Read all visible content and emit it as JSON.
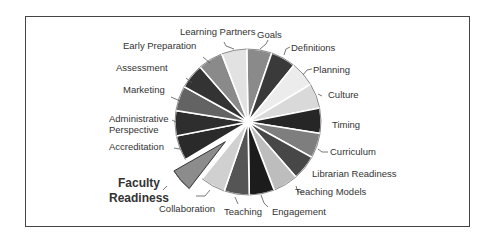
{
  "chart_data": {
    "type": "pie",
    "title": "",
    "start_angle_deg": 0,
    "direction": "clockwise",
    "highlighted": "Faculty Readiness",
    "slices": [
      {
        "label": "Goals",
        "value": 1,
        "color": "#8a8a8a"
      },
      {
        "label": "Definitions",
        "value": 1,
        "color": "#3a3a3a"
      },
      {
        "label": "Planning",
        "value": 1,
        "color": "#ececec"
      },
      {
        "label": "Culture",
        "value": 1,
        "color": "#d9d9d9"
      },
      {
        "label": "Timing",
        "value": 1,
        "color": "#262626"
      },
      {
        "label": "Curriculum",
        "value": 1,
        "color": "#7e7e7e"
      },
      {
        "label": "Librarian Readiness",
        "value": 1,
        "color": "#474747"
      },
      {
        "label": "Teaching Models",
        "value": 1,
        "color": "#bdbdbd"
      },
      {
        "label": "Engagement",
        "value": 1,
        "color": "#1c1c1c"
      },
      {
        "label": "Teaching",
        "value": 1,
        "color": "#555555"
      },
      {
        "label": "Collaboration",
        "value": 1,
        "color": "#d0d0d0"
      },
      {
        "label": "Faculty Readiness",
        "value": 1,
        "color": "#8c8c8c",
        "exploded": true
      },
      {
        "label": "Accreditation",
        "value": 1,
        "color": "#2a2a2a"
      },
      {
        "label": "Administrative Perspective",
        "value": 1,
        "color": "#2e2e2e"
      },
      {
        "label": "Marketing",
        "value": 1,
        "color": "#636363"
      },
      {
        "label": "Assessment",
        "value": 1,
        "color": "#333333"
      },
      {
        "label": "Early Preparation",
        "value": 1,
        "color": "#8a8a8a"
      },
      {
        "label": "Learning Partners",
        "value": 1,
        "color": "#e2e2e2"
      }
    ]
  },
  "labels": {
    "goals": "Goals",
    "definitions": "Definitions",
    "planning": "Planning",
    "culture": "Culture",
    "timing": "Timing",
    "curriculum": "Curriculum",
    "librarian_readiness": "Librarian Readiness",
    "teaching_models": "Teaching Models",
    "engagement": "Engagement",
    "teaching": "Teaching",
    "collaboration": "Collaboration",
    "faculty_readiness_1": "Faculty",
    "faculty_readiness_2": "Readiness",
    "accreditation": "Accreditation",
    "administrative_1": "Administrative",
    "administrative_2": "Perspective",
    "marketing": "Marketing",
    "assessment": "Assessment",
    "early_preparation": "Early Preparation",
    "learning_partners": "Learning Partners"
  }
}
